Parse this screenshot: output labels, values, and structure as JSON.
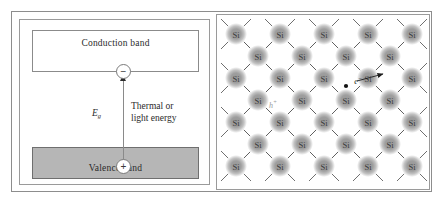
{
  "band_diagram": {
    "conduction_band_label": "Conduction band",
    "valence_band_label": "Valence band",
    "electron_symbol": "−",
    "hole_symbol": "+",
    "energy_gap_label": "E",
    "energy_gap_subscript": "g",
    "excitation_caption_line1": "Thermal or",
    "excitation_caption_line2": "light energy",
    "colors": {
      "valence_fill": "#b6b6b6",
      "conduction_fill": "#ffffff",
      "arrow": "#8a8a8a"
    }
  },
  "lattice": {
    "atom_label": "Si",
    "electron_annotation": "e",
    "electron_annotation_superscript": "−",
    "hole_annotation": "h",
    "hole_annotation_superscript": "+",
    "rows": [
      {
        "count": 5,
        "x_start": 19,
        "x_step": 44,
        "y": 19
      },
      {
        "count": 4,
        "x_step": 44,
        "x_start": 41,
        "y": 41
      },
      {
        "count": 5,
        "x_start": 19,
        "x_step": 44,
        "y": 63
      },
      {
        "count": 4,
        "x_start": 41,
        "x_step": 44,
        "y": 85
      },
      {
        "count": 5,
        "x_start": 19,
        "x_step": 44,
        "y": 107
      },
      {
        "count": 4,
        "x_start": 41,
        "x_step": 44,
        "y": 129
      },
      {
        "count": 5,
        "x_start": 19,
        "x_step": 44,
        "y": 151
      }
    ],
    "atom_radius": 11,
    "bond_half_length": 15,
    "colors": {
      "atom_core": "#9e9e9e",
      "atom_edge": "#ffffff",
      "bond": "#5f5f5f"
    },
    "free_electron": {
      "x": 129,
      "y": 71
    },
    "electron_arrow": {
      "x1": 140,
      "y1": 66,
      "x2": 166,
      "y2": 59
    },
    "hole_site": {
      "x": 56,
      "y": 90
    }
  }
}
